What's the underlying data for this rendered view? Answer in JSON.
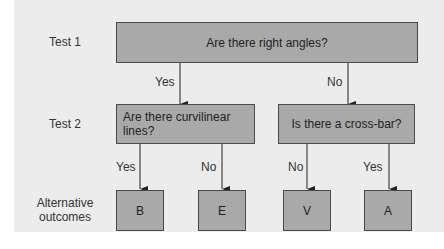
{
  "row_labels": {
    "test1": "Test 1",
    "test2": "Test 2",
    "outcomes_line1": "Alternative",
    "outcomes_line2": "outcomes"
  },
  "nodes": {
    "root": "Are there right angles?",
    "left": "Are there curvilinear lines?",
    "right": "Is there a cross-bar?",
    "outcome_b": "B",
    "outcome_e": "E",
    "outcome_v": "V",
    "outcome_a": "A"
  },
  "edges": {
    "root_yes": "Yes",
    "root_no": "No",
    "left_yes": "Yes",
    "left_no": "No",
    "right_no": "No",
    "right_yes": "Yes"
  },
  "colors": {
    "panel": "#ececec",
    "box_fill": "#a9a9a9",
    "box_border": "#4a4a4a",
    "line": "#222222"
  }
}
